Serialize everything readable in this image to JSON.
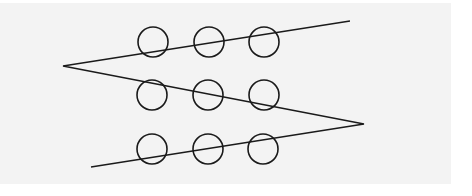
{
  "diagram": {
    "colors": {
      "background": "#ffffff",
      "panel": "#f3f3f3",
      "stroke": "#1a1a1a"
    },
    "dots": [
      {
        "row": 1,
        "col": 1,
        "cx": 153,
        "cy": 42,
        "r": 15
      },
      {
        "row": 1,
        "col": 2,
        "cx": 209,
        "cy": 42,
        "r": 15
      },
      {
        "row": 1,
        "col": 3,
        "cx": 264,
        "cy": 42,
        "r": 15
      },
      {
        "row": 2,
        "col": 1,
        "cx": 152,
        "cy": 95,
        "r": 15
      },
      {
        "row": 2,
        "col": 2,
        "cx": 208,
        "cy": 95,
        "r": 15
      },
      {
        "row": 2,
        "col": 3,
        "cx": 264,
        "cy": 95,
        "r": 15
      },
      {
        "row": 3,
        "col": 1,
        "cx": 152,
        "cy": 149,
        "r": 15
      },
      {
        "row": 3,
        "col": 2,
        "cx": 208,
        "cy": 149,
        "r": 15
      },
      {
        "row": 3,
        "col": 3,
        "cx": 263,
        "cy": 149,
        "r": 15
      }
    ],
    "path_points": [
      [
        350,
        21
      ],
      [
        63,
        66
      ],
      [
        364,
        124
      ],
      [
        91,
        167
      ]
    ]
  }
}
